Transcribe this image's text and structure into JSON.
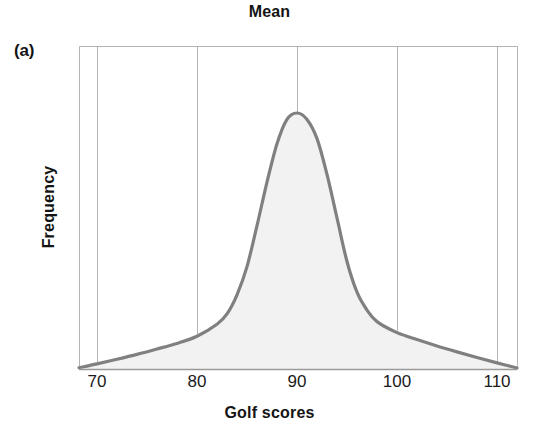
{
  "panel": {
    "label": "(a)"
  },
  "chart_data": {
    "type": "area",
    "title": "Mean",
    "xlabel": "Golf scores",
    "ylabel": "Frequency",
    "xlim": [
      68.2,
      112.0
    ],
    "ylim": [
      0,
      1.0
    ],
    "xticks": [
      70,
      80,
      90,
      100,
      110
    ],
    "xtick_labels": [
      "70",
      "80",
      "90",
      "100",
      "110"
    ],
    "yticks": [],
    "ytick_labels": [],
    "grid": "vertical-only",
    "legend": null,
    "annotations": [
      {
        "text": "Mean",
        "x": 90,
        "y": 1.0,
        "type": "vertical-gridline-marker",
        "description": "Title 'Mean' labels the vertical line at the center of the symmetric distribution at golf score 90"
      }
    ],
    "series": [
      {
        "name": "Frequency distribution of golf scores",
        "description": "Symmetric, heavy-tailed (leptokurtic) unimodal bell curve peaking at the mean score of 90",
        "peak_x": 90,
        "peak_y": 1.0,
        "mean": 90,
        "median": 90,
        "mode": 90,
        "x": [
          68.2,
          70,
          72,
          74,
          76,
          78,
          80,
          82,
          83,
          84,
          85,
          86,
          87,
          88,
          89,
          90,
          91,
          92,
          93,
          94,
          95,
          96,
          97,
          98,
          100,
          102,
          104,
          106,
          108,
          110,
          112
        ],
        "y": [
          0.005,
          0.02,
          0.038,
          0.057,
          0.078,
          0.1,
          0.128,
          0.175,
          0.215,
          0.29,
          0.4,
          0.56,
          0.73,
          0.88,
          0.975,
          1.0,
          0.975,
          0.9,
          0.76,
          0.59,
          0.42,
          0.3,
          0.23,
          0.185,
          0.142,
          0.115,
          0.09,
          0.067,
          0.045,
          0.024,
          0.004
        ]
      }
    ],
    "colors": {
      "curve": "#808080",
      "fill": "#f2f2f2",
      "gridline": "#b4b4b4",
      "axis": "#9a9a9a",
      "text": "#141414",
      "background": "#ffffff"
    }
  }
}
